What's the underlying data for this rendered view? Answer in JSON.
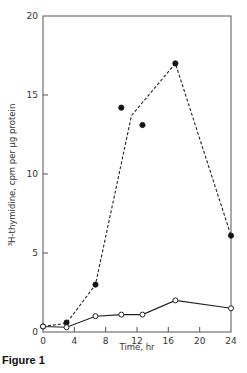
{
  "caption": "Figure 1",
  "chart_data": {
    "type": "line",
    "title": "",
    "xlabel": "Time, hr",
    "ylabel": "³H-thymidine, cpm per µg protein",
    "xlim": [
      0,
      24
    ],
    "ylim": [
      0,
      20
    ],
    "x_ticks": [
      0,
      4,
      8,
      12,
      16,
      20,
      24
    ],
    "y_ticks": [
      0,
      5,
      10,
      15,
      20
    ],
    "grid": false,
    "legend": null,
    "series": [
      {
        "name": "filled circles (dashed line)",
        "marker": "filled-circle",
        "line_style": "dashed",
        "points": [
          [
            0,
            0.35
          ],
          [
            3,
            0.6
          ],
          [
            6.7,
            3.0
          ],
          [
            10,
            14.2
          ],
          [
            12.7,
            13.1
          ],
          [
            16.9,
            17.0
          ],
          [
            24,
            6.1
          ]
        ],
        "line_path": [
          [
            0,
            0.35
          ],
          [
            3,
            0.55
          ],
          [
            6.7,
            3.0
          ],
          [
            11.3,
            13.7
          ],
          [
            16.9,
            17.0
          ],
          [
            24,
            6.1
          ]
        ]
      },
      {
        "name": "open circles (solid line)",
        "marker": "open-circle",
        "line_style": "solid",
        "points": [
          [
            0,
            0.35
          ],
          [
            3,
            0.3
          ],
          [
            6.7,
            1.0
          ],
          [
            10,
            1.1
          ],
          [
            12.7,
            1.1
          ],
          [
            16.9,
            2.0
          ],
          [
            24,
            1.5
          ]
        ],
        "line_path": [
          [
            0,
            0.35
          ],
          [
            3,
            0.3
          ],
          [
            6.7,
            1.0
          ],
          [
            10,
            1.1
          ],
          [
            12.7,
            1.1
          ],
          [
            16.9,
            2.0
          ],
          [
            24,
            1.5
          ]
        ]
      }
    ]
  }
}
